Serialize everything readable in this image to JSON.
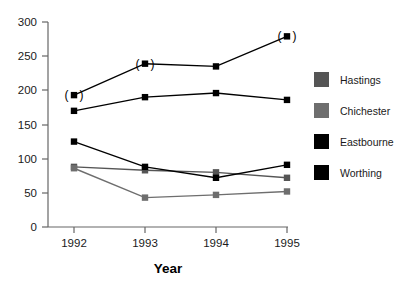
{
  "chart_data": {
    "type": "line",
    "title": "",
    "xlabel": "Year",
    "ylabel": "",
    "categories": [
      "1992",
      "1993",
      "1994",
      "1995"
    ],
    "x": [
      1992,
      1993,
      1994,
      1995
    ],
    "xlim": [
      1991.6,
      1995.4
    ],
    "ylim": [
      0,
      300
    ],
    "yticks": [
      "0",
      "50",
      "100",
      "150",
      "200",
      "250",
      "300"
    ],
    "ytick_values": [
      0,
      50,
      100,
      150,
      200,
      250,
      300
    ],
    "grid": false,
    "legend_position": "right",
    "series": [
      {
        "name": "Hastings",
        "color": "#555555",
        "marker": "square",
        "values": [
          88,
          83,
          80,
          72
        ]
      },
      {
        "name": "Chichester",
        "color": "#6e6e6e",
        "marker": "square",
        "values": [
          86,
          43,
          47,
          52
        ]
      },
      {
        "name": "Eastbourne",
        "color": "#000000",
        "marker": "square",
        "values": [
          125,
          88,
          72,
          91
        ]
      },
      {
        "name": "Worthing",
        "color": "#000000",
        "marker": "square",
        "values": [
          193,
          239,
          235,
          279
        ]
      },
      {
        "name": "Eastbourne upper",
        "color": "#000000",
        "marker": "square",
        "values": [
          170,
          190,
          196,
          186
        ]
      }
    ],
    "annotations": [
      {
        "text": "(",
        "x": 1992,
        "y": 193
      },
      {
        "text": ")",
        "x": 1992,
        "y": 193
      },
      {
        "text": "(",
        "x": 1993,
        "y": 239
      },
      {
        "text": ")",
        "x": 1993,
        "y": 239
      },
      {
        "text": "(",
        "x": 1995,
        "y": 279
      },
      {
        "text": ")",
        "x": 1995,
        "y": 279
      }
    ]
  },
  "axis": {
    "x_title": "Year",
    "y_ticks": [
      "300",
      "250",
      "200",
      "150",
      "100",
      "50",
      "0"
    ],
    "x_ticks": [
      "1992",
      "1993",
      "1994",
      "1995"
    ]
  },
  "legend": {
    "items": [
      {
        "label": "Hastings",
        "color": "#555555"
      },
      {
        "label": "Chichester",
        "color": "#6e6e6e"
      },
      {
        "label": "Eastbourne",
        "color": "#000000"
      },
      {
        "label": "Worthing",
        "color": "#000000"
      }
    ]
  }
}
